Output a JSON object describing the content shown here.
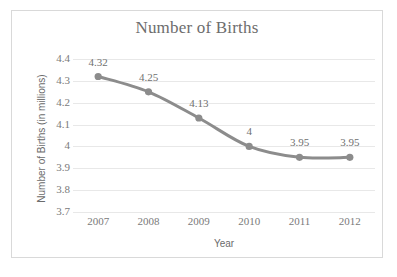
{
  "chart_data": {
    "type": "line",
    "title": "Number of Births",
    "xlabel": "Year",
    "ylabel": "Number of Births (in millions)",
    "categories": [
      "2007",
      "2008",
      "2009",
      "2010",
      "2011",
      "2012"
    ],
    "values": [
      4.32,
      4.25,
      4.13,
      4,
      3.95,
      3.95
    ],
    "data_labels": [
      "4.32",
      "4.25",
      "4.13",
      "4",
      "3.95",
      "3.95"
    ],
    "ylim": [
      3.7,
      4.4
    ],
    "yticks": [
      "4.4",
      "4.3",
      "4.2",
      "4.1",
      "4",
      "3.9",
      "3.8",
      "3.7"
    ],
    "ytick_values": [
      4.4,
      4.3,
      4.2,
      4.1,
      4.0,
      3.9,
      3.8,
      3.7
    ],
    "grid": true,
    "legend": "none",
    "series_color": "#8c8c8c",
    "gridline_color": "#e8e8e8",
    "text_color": "#6f6f6f",
    "border_color": "#d9d9d9",
    "background": "#ffffff",
    "marker": "circle",
    "line_width": 3
  }
}
